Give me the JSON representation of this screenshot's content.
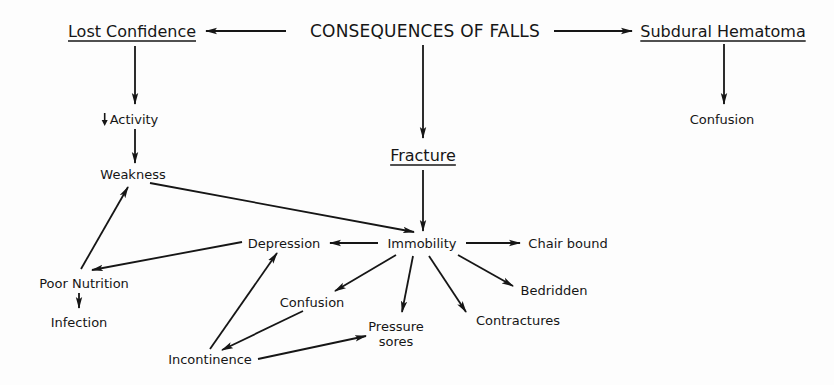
{
  "diagram": {
    "title": "CONSEQUENCES OF FALLS",
    "colors": {
      "ink": "#161616",
      "background": "#fdfdfd"
    },
    "nodes": [
      {
        "id": "consequences",
        "label": "CONSEQUENCES OF FALLS",
        "x": 425,
        "y": 37,
        "size": "title",
        "underline": false
      },
      {
        "id": "lost_confidence",
        "label": "Lost Confidence",
        "x": 132,
        "y": 37,
        "size": "major",
        "underline": true
      },
      {
        "id": "subdural_hematoma",
        "label": "Subdural Hematoma",
        "x": 723,
        "y": 37,
        "size": "major",
        "underline": true
      },
      {
        "id": "activity",
        "label": "Activity",
        "prefix_icon": "down-arrow",
        "x": 134,
        "y": 124,
        "size": "minor",
        "underline": false
      },
      {
        "id": "confusion_sh",
        "label": "Confusion",
        "x": 722,
        "y": 124,
        "size": "minor",
        "underline": false
      },
      {
        "id": "fracture",
        "label": "Fracture",
        "x": 423,
        "y": 161,
        "size": "major",
        "underline": true
      },
      {
        "id": "weakness",
        "label": "Weakness",
        "x": 133,
        "y": 179,
        "size": "minor",
        "underline": false
      },
      {
        "id": "depression",
        "label": "Depression",
        "x": 284,
        "y": 248,
        "size": "minor",
        "underline": false
      },
      {
        "id": "immobility",
        "label": "Immobility",
        "x": 422,
        "y": 248,
        "size": "minor",
        "underline": false
      },
      {
        "id": "chair_bound",
        "label": "Chair bound",
        "x": 568,
        "y": 248,
        "size": "minor",
        "underline": false
      },
      {
        "id": "poor_nutrition",
        "label": "Poor Nutrition",
        "x": 84,
        "y": 288,
        "size": "minor",
        "underline": false
      },
      {
        "id": "bedridden",
        "label": "Bedridden",
        "x": 554,
        "y": 295,
        "size": "minor",
        "underline": false
      },
      {
        "id": "confusion_im",
        "label": "Confusion",
        "x": 312,
        "y": 307,
        "size": "minor",
        "underline": false
      },
      {
        "id": "infection",
        "label": "Infection",
        "x": 79,
        "y": 327,
        "size": "minor",
        "underline": false
      },
      {
        "id": "pressure_sores_1",
        "label": "Pressure",
        "x": 396,
        "y": 331,
        "size": "minor",
        "underline": false
      },
      {
        "id": "pressure_sores_2",
        "label": "sores",
        "x": 396,
        "y": 346,
        "size": "minor",
        "underline": false
      },
      {
        "id": "contractures",
        "label": "Contractures",
        "x": 518,
        "y": 325,
        "size": "minor",
        "underline": false
      },
      {
        "id": "incontinence",
        "label": "Incontinence",
        "x": 210,
        "y": 364,
        "size": "minor",
        "underline": false
      }
    ],
    "edges": [
      {
        "from": "consequences",
        "to": "lost_confidence",
        "x1": 286,
        "y1": 31,
        "x2": 206,
        "y2": 31
      },
      {
        "from": "consequences",
        "to": "subdural_hematoma",
        "x1": 554,
        "y1": 31,
        "x2": 632,
        "y2": 31
      },
      {
        "from": "consequences",
        "to": "fracture",
        "x1": 423,
        "y1": 45,
        "x2": 423,
        "y2": 138
      },
      {
        "from": "lost_confidence",
        "to": "activity",
        "x1": 135,
        "y1": 46,
        "x2": 135,
        "y2": 104
      },
      {
        "from": "subdural_hematoma",
        "to": "confusion_sh",
        "x1": 724,
        "y1": 44,
        "x2": 724,
        "y2": 104
      },
      {
        "from": "activity",
        "to": "weakness",
        "x1": 135,
        "y1": 129,
        "x2": 135,
        "y2": 163
      },
      {
        "from": "fracture",
        "to": "immobility",
        "x1": 423,
        "y1": 170,
        "x2": 423,
        "y2": 231
      },
      {
        "from": "weakness",
        "to": "immobility",
        "x1": 150,
        "y1": 183,
        "x2": 414,
        "y2": 232
      },
      {
        "from": "immobility",
        "to": "depression",
        "x1": 378,
        "y1": 243,
        "x2": 330,
        "y2": 243
      },
      {
        "from": "immobility",
        "to": "chair_bound",
        "x1": 466,
        "y1": 243,
        "x2": 520,
        "y2": 243
      },
      {
        "from": "depression",
        "to": "poor_nutrition",
        "x1": 242,
        "y1": 242,
        "x2": 92,
        "y2": 270
      },
      {
        "from": "poor_nutrition",
        "to": "weakness",
        "x1": 81,
        "y1": 269,
        "x2": 128,
        "y2": 187
      },
      {
        "from": "poor_nutrition",
        "to": "infection",
        "x1": 79,
        "y1": 293,
        "x2": 79,
        "y2": 308
      },
      {
        "from": "immobility",
        "to": "confusion_im",
        "x1": 396,
        "y1": 255,
        "x2": 335,
        "y2": 291
      },
      {
        "from": "immobility",
        "to": "pressure_sores",
        "x1": 413,
        "y1": 256,
        "x2": 402,
        "y2": 312
      },
      {
        "from": "immobility",
        "to": "contractures",
        "x1": 429,
        "y1": 256,
        "x2": 466,
        "y2": 312
      },
      {
        "from": "immobility",
        "to": "bedridden",
        "x1": 458,
        "y1": 255,
        "x2": 513,
        "y2": 286
      },
      {
        "from": "confusion_im",
        "to": "incontinence",
        "x1": 303,
        "y1": 311,
        "x2": 222,
        "y2": 350
      },
      {
        "from": "incontinence",
        "to": "depression",
        "x1": 210,
        "y1": 349,
        "x2": 277,
        "y2": 253
      },
      {
        "from": "incontinence",
        "to": "pressure_sores",
        "x1": 258,
        "y1": 359,
        "x2": 366,
        "y2": 336
      }
    ]
  }
}
